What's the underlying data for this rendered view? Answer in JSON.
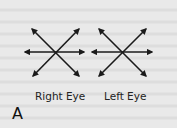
{
  "figure": {
    "panel_label": "A",
    "diagrams": [
      {
        "label": "Right Eye",
        "arrows": [
          "up-left",
          "up-right",
          "left",
          "right",
          "down-left",
          "down-right"
        ]
      },
      {
        "label": "Left Eye",
        "arrows": [
          "up-left",
          "up-right",
          "left",
          "right",
          "down-left",
          "down-right"
        ]
      }
    ]
  },
  "colors": {
    "background": "#e9e9e9",
    "ink": "#1a1a1a"
  }
}
